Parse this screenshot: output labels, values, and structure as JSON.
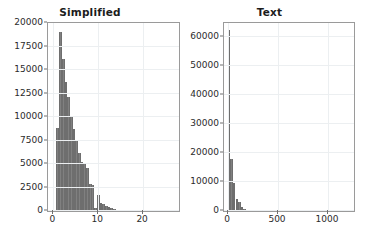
{
  "figure": {
    "background": "#ffffff",
    "bar_color": "#808080",
    "grid_color": "#eceff1",
    "axis_color": "#9a9a9a",
    "text_color": "#2b2b2b"
  },
  "chart_data": [
    {
      "type": "bar",
      "id": "simplified-histogram",
      "title": "Simplified",
      "xlabel": "",
      "ylabel": "",
      "xlim": [
        -1.2,
        28.0
      ],
      "ylim": [
        0,
        20000
      ],
      "grid": true,
      "legend": null,
      "xticks": [
        0,
        10,
        20
      ],
      "xticklabels": [
        "0",
        "10",
        "20"
      ],
      "yticks": [
        0,
        2500,
        5000,
        7500,
        10000,
        12500,
        15000,
        17500,
        20000
      ],
      "yticklabels": [
        "0",
        "2500",
        "5000",
        "7500",
        "10000",
        "12500",
        "15000",
        "17500",
        "20000"
      ],
      "bin_width": 0.62,
      "x": [
        1.0,
        1.6,
        2.2,
        2.8,
        3.4,
        4.0,
        4.6,
        5.2,
        5.8,
        6.4,
        7.0,
        7.6,
        8.2,
        8.8,
        9.4,
        10.0,
        10.6,
        11.2,
        11.8,
        12.4,
        13.0,
        13.6,
        14.2,
        14.8,
        15.4,
        16.0,
        16.6,
        17.2
      ],
      "values": [
        8800,
        19000,
        16200,
        13700,
        12100,
        10100,
        8700,
        7600,
        6200,
        5200,
        5000,
        4600,
        2900,
        2800,
        300,
        1700,
        900,
        700,
        500,
        400,
        300,
        220,
        160,
        110,
        70,
        40,
        25,
        15
      ]
    },
    {
      "type": "bar",
      "id": "text-histogram",
      "title": "Text",
      "xlabel": "",
      "ylabel": "",
      "xlim": [
        -40,
        1260
      ],
      "ylim": [
        0,
        65000
      ],
      "grid": true,
      "legend": null,
      "xticks": [
        0,
        500,
        1000
      ],
      "xticklabels": [
        "0",
        "500",
        "1000"
      ],
      "yticks": [
        0,
        10000,
        20000,
        30000,
        40000,
        50000,
        60000
      ],
      "yticklabels": [
        "0",
        "10000",
        "20000",
        "30000",
        "40000",
        "50000",
        "60000"
      ],
      "bin_width": 26,
      "x": [
        10,
        36,
        62,
        88,
        114,
        140,
        166,
        192,
        218,
        244,
        270,
        296,
        322,
        348,
        374,
        400
      ],
      "values": [
        62500,
        18000,
        9600,
        4200,
        3000,
        1400,
        700,
        400,
        250,
        150,
        90,
        60,
        40,
        25,
        15,
        10
      ]
    }
  ]
}
